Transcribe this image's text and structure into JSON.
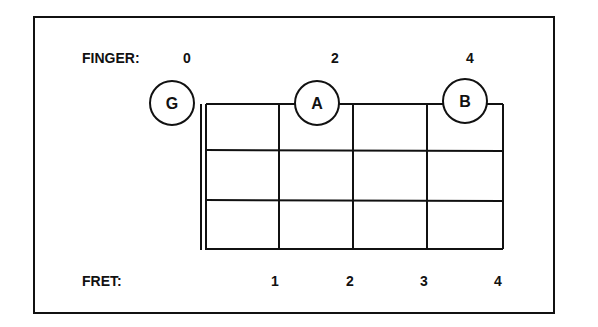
{
  "diagram": {
    "type": "fretboard-chart",
    "finger_row": {
      "label": "FINGER:",
      "values": [
        "0",
        "2",
        "4"
      ]
    },
    "fret_row": {
      "label": "FRET:",
      "values": [
        "1",
        "2",
        "3",
        "4"
      ]
    },
    "notes": [
      {
        "name": "G",
        "finger": "0",
        "fret": "open"
      },
      {
        "name": "A",
        "finger": "2",
        "fret": "2"
      },
      {
        "name": "B",
        "finger": "4",
        "fret": "4"
      }
    ],
    "grid": {
      "frets": 4,
      "strings_rows": 3
    },
    "colors": {
      "line": "#111111",
      "background": "#ffffff"
    }
  }
}
